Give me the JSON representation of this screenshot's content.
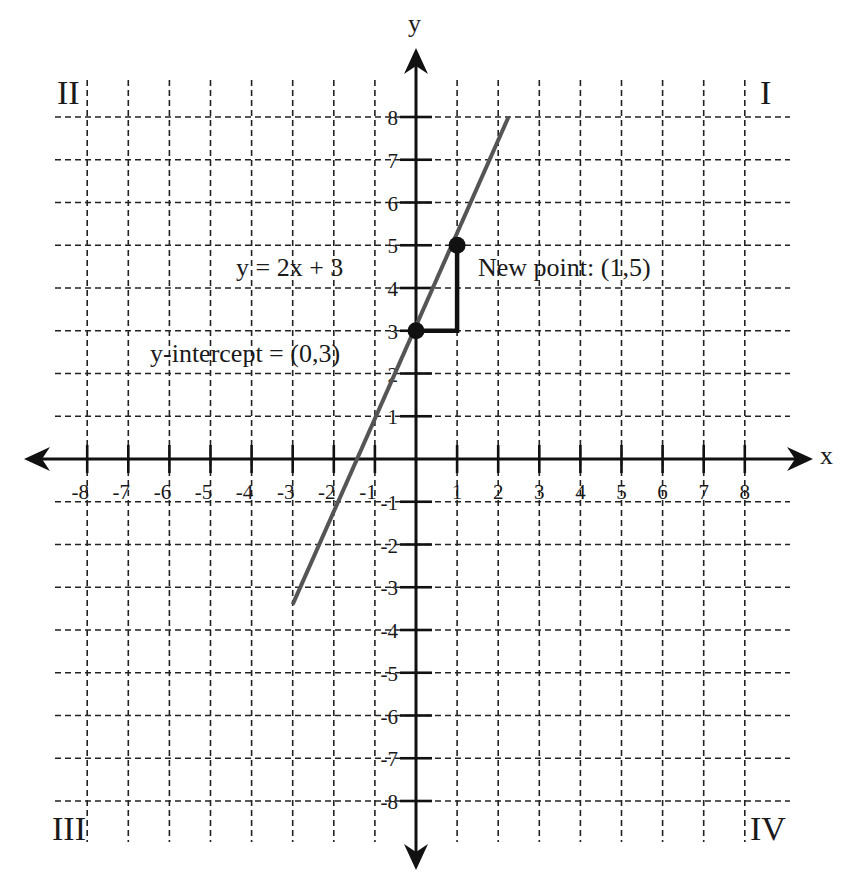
{
  "chart_data": {
    "type": "line",
    "title": "",
    "xlabel": "x",
    "ylabel": "y",
    "xlim": [
      -8,
      8
    ],
    "ylim": [
      -8,
      8
    ],
    "grid": true,
    "x_ticks": [
      -8,
      -7,
      -6,
      -5,
      -4,
      -3,
      -2,
      -1,
      1,
      2,
      3,
      4,
      5,
      6,
      7,
      8
    ],
    "y_ticks": [
      8,
      7,
      6,
      5,
      4,
      3,
      2,
      1,
      -1,
      -2,
      -3,
      -4,
      -5,
      -6,
      -7,
      -8
    ],
    "series": [
      {
        "name": "y = 2x + 3",
        "equation": "y = 2x + 3",
        "slope": 2,
        "intercept": 3,
        "x": [
          -3,
          2.25
        ],
        "y": [
          -3.4,
          8
        ],
        "color": "#555555"
      }
    ],
    "points": [
      {
        "label": "y-intercept = (0,3)",
        "x": 0,
        "y": 3
      },
      {
        "label": "New point: (1,5)",
        "x": 1,
        "y": 5
      }
    ],
    "slope_triangle": {
      "run_from": [
        0,
        3
      ],
      "run_to": [
        1,
        3
      ],
      "rise_to": [
        1,
        5
      ]
    },
    "annotations": [
      {
        "text": "y = 2x + 3",
        "x": -3.5,
        "y": 4.5
      },
      {
        "text": "New point: (1,5)",
        "x": 1.5,
        "y": 4.5
      },
      {
        "text": "y-intercept = (0,3)",
        "x": -3.5,
        "y": 2.5
      }
    ],
    "quadrant_labels": [
      "I",
      "II",
      "III",
      "IV"
    ]
  },
  "labels": {
    "x_axis": "x",
    "y_axis": "y",
    "equation": "y = 2x + 3",
    "new_point": "New point: (1,5)",
    "y_intercept": "y-intercept = (0,3)",
    "quadrant_1": "I",
    "quadrant_2": "II",
    "quadrant_3": "III",
    "quadrant_4": "IV"
  },
  "colors": {
    "axis": "#111111",
    "grid": "#222222",
    "line": "#555555",
    "points": "#111111"
  }
}
